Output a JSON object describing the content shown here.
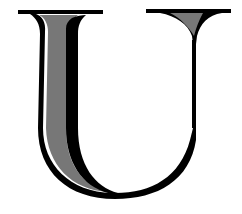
{
  "image": {
    "description": "Decorative serif capital letter with gray shaded fill and black outline",
    "letter": "U",
    "colors": {
      "background": "#ffffff",
      "outline": "#000000",
      "fill": "#777777"
    }
  }
}
